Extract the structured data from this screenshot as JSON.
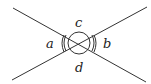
{
  "diagram": {
    "type": "intersecting-lines-angles",
    "labels": {
      "left": "a",
      "right": "b",
      "top": "c",
      "bottom": "d"
    },
    "colors": {
      "stroke": "#333333",
      "text": "#222222"
    }
  }
}
